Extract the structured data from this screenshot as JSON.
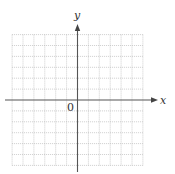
{
  "diagram": {
    "type": "coordinate-grid",
    "x_axis_label": "x",
    "y_axis_label": "y",
    "origin_label": "0",
    "grid": {
      "columns_left": 6,
      "columns_right": 6,
      "rows_above": 6,
      "rows_below": 6,
      "style": "dotted"
    },
    "colors": {
      "axis": "#555555",
      "grid": "#b8b8b8",
      "text": "#333333",
      "background": "#ffffff"
    }
  }
}
